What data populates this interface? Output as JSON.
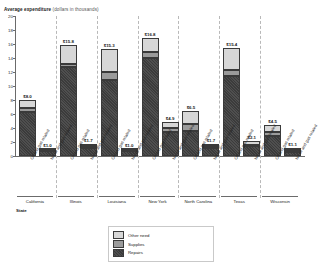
{
  "chart_data": {
    "type": "bar",
    "title": "Average expenditure",
    "subtitle": "(dollars in thousands)",
    "ylabel": "Average expenditure",
    "xlabel": "State",
    "ylim": [
      0,
      20
    ],
    "yticks": [
      "20",
      "18",
      "16",
      "14",
      "12",
      "10",
      "8",
      "6",
      "4",
      "2",
      "0"
    ],
    "grid": false,
    "legend_position": "bottom-center",
    "stacked": true,
    "series": [
      {
        "name": "Other need",
        "color": "#d7d7d7",
        "values": [
          1.2,
          0.2,
          2.6,
          0.3,
          3.3,
          0.2,
          1.9,
          0.9,
          1.9,
          0.3,
          3.1,
          0.5,
          1.1,
          0.3
        ]
      },
      {
        "name": "Supplies",
        "color": "#9b9b9b",
        "values": [
          0.5,
          0.1,
          0.5,
          0.2,
          1.1,
          0.1,
          0.9,
          0.5,
          1.0,
          0.2,
          0.8,
          0.2,
          0.5,
          0.2
        ]
      },
      {
        "name": "Repairs",
        "color": "#3b3b3b",
        "values": [
          6.3,
          0.7,
          12.7,
          1.2,
          10.9,
          0.7,
          14.0,
          3.5,
          3.6,
          1.2,
          11.5,
          1.4,
          2.9,
          0.6
        ]
      }
    ],
    "categories": [
      "Oil and gas related",
      "No oil and gas related",
      "Oil and gas related",
      "No oil and gas related",
      "Oil and gas related",
      "No oil and gas related",
      "Oil and gas related",
      "No oil and gas related",
      "Oil and gas related",
      "No oil and gas related",
      "Oil and gas related",
      "No oil and gas related",
      "Oil and gas related",
      "No oil and gas related"
    ],
    "totals": [
      "$8.0",
      "$1.0",
      "$15.8",
      "$1.7",
      "$15.3",
      "$1.0",
      "$16.8",
      "$4.9",
      "$6.5",
      "$1.7",
      "$15.4",
      "$2.1",
      "$4.5",
      "$1.1"
    ],
    "totals_numeric": [
      8.0,
      1.0,
      15.8,
      1.7,
      15.3,
      1.0,
      16.8,
      4.9,
      6.5,
      1.7,
      15.4,
      2.1,
      4.5,
      1.1
    ],
    "groups": [
      "California",
      "Illinois",
      "Louisiana",
      "New York",
      "North Carolina",
      "Texas",
      "Wisconsin"
    ]
  },
  "legend": {
    "items": [
      {
        "label": "Other need",
        "color": "#d7d7d7"
      },
      {
        "label": "Supplies",
        "color": "#9b9b9b"
      },
      {
        "label": "Repairs",
        "color": "#3b3b3b"
      }
    ]
  }
}
